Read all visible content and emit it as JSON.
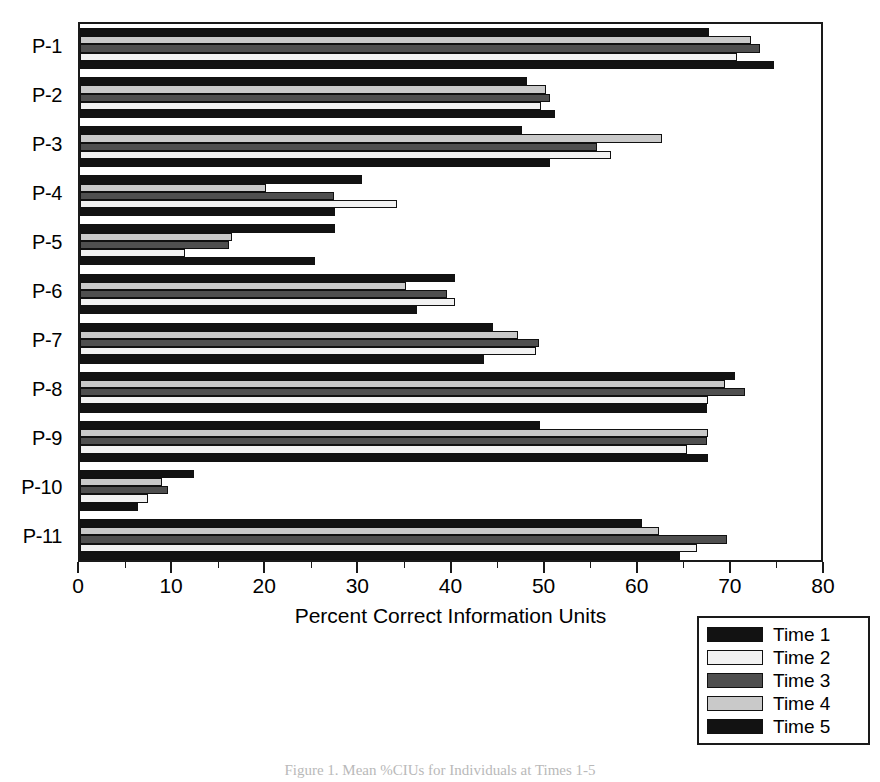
{
  "figure": {
    "caption": "Figure 1. Mean %CIUs for Individuals at Times 1-5"
  },
  "chart_data": {
    "type": "bar",
    "orientation": "horizontal",
    "title": "",
    "xlabel": "Percent Correct Information Units",
    "ylabel": "",
    "xlim": [
      0,
      80
    ],
    "xticks": [
      0,
      10,
      20,
      30,
      40,
      50,
      60,
      70,
      80
    ],
    "xtick_labels": [
      "0",
      "10",
      "20",
      "30",
      "40",
      "50",
      "60",
      "70",
      "80"
    ],
    "minor_tick_step": 5,
    "grid": false,
    "legend_position": "bottom-right",
    "categories": [
      "P-1",
      "P-2",
      "P-3",
      "P-4",
      "P-5",
      "P-6",
      "P-7",
      "P-8",
      "P-9",
      "P-10",
      "P-11"
    ],
    "series": [
      {
        "name": "Time 5",
        "color": "#121212",
        "values": [
          67.5,
          48.0,
          47.5,
          30.3,
          27.4,
          40.3,
          44.3,
          70.3,
          49.4,
          12.2,
          60.3
        ]
      },
      {
        "name": "Time 4",
        "color": "#c9c9c9",
        "values": [
          72.0,
          50.0,
          62.5,
          20.0,
          16.3,
          35.0,
          47.0,
          69.3,
          67.4,
          8.8,
          62.2
        ]
      },
      {
        "name": "Time 3",
        "color": "#4f4f4f",
        "values": [
          73.0,
          50.5,
          55.5,
          27.3,
          16.0,
          39.4,
          49.3,
          71.4,
          67.3,
          9.4,
          69.5
        ]
      },
      {
        "name": "Time 2",
        "color": "#f2f2f2",
        "values": [
          70.5,
          49.5,
          57.0,
          34.0,
          11.3,
          40.3,
          49.0,
          67.4,
          65.2,
          7.3,
          66.3
        ]
      },
      {
        "name": "Time 1",
        "color": "#121212",
        "values": [
          74.5,
          51.0,
          50.5,
          27.4,
          25.2,
          36.2,
          43.4,
          67.3,
          67.4,
          6.2,
          64.4
        ]
      }
    ]
  }
}
